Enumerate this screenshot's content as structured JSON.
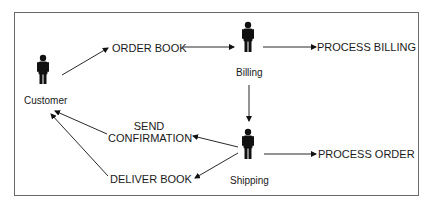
{
  "diagram": {
    "colors": {
      "ink": "#111111",
      "frame": "#6a6a6a",
      "background": "#ffffff"
    },
    "actors": [
      {
        "id": "customer",
        "label": "Customer"
      },
      {
        "id": "billing",
        "label": "Billing"
      },
      {
        "id": "shipping",
        "label": "Shipping"
      }
    ],
    "actions": [
      {
        "id": "order_book",
        "label": "ORDER BOOK"
      },
      {
        "id": "process_billing",
        "label": "PROCESS BILLING"
      },
      {
        "id": "send_confirmation",
        "label_line1": "SEND",
        "label_line2": "CONFIRMATION"
      },
      {
        "id": "deliver_book",
        "label": "DELIVER BOOK"
      },
      {
        "id": "process_order",
        "label": "PROCESS ORDER"
      }
    ],
    "flows": [
      {
        "from": "Customer",
        "to": "ORDER BOOK"
      },
      {
        "from": "ORDER BOOK",
        "to": "Billing"
      },
      {
        "from": "Billing",
        "to": "PROCESS BILLING"
      },
      {
        "from": "Billing",
        "to": "Shipping"
      },
      {
        "from": "Shipping",
        "to": "SEND CONFIRMATION"
      },
      {
        "from": "Shipping",
        "to": "DELIVER BOOK"
      },
      {
        "from": "Shipping",
        "to": "PROCESS ORDER"
      },
      {
        "from": "SEND CONFIRMATION",
        "to": "Customer"
      },
      {
        "from": "DELIVER BOOK",
        "to": "Customer"
      }
    ]
  }
}
